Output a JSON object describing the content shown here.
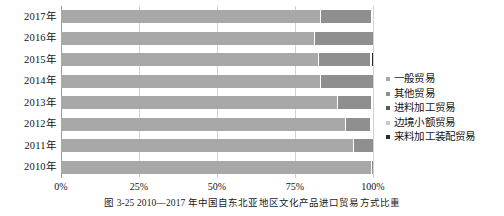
{
  "caption": "图 3-25  2010—2017 年中国自东北亚地区文化产品进口贸易方式比重",
  "axis": {
    "xticks": [
      "0%",
      "25%",
      "50%",
      "75%",
      "100%"
    ]
  },
  "legend": {
    "items": [
      {
        "label": "一般贸易",
        "color": "#a8a8a8"
      },
      {
        "label": "其他贸易",
        "color": "#8f8f8f"
      },
      {
        "label": "进料加工贸易",
        "color": "#5a5a5a"
      },
      {
        "label": "边境小额贸易",
        "color": "#c9c9c9"
      },
      {
        "label": "来料加工装配贸易",
        "color": "#2b2b2b"
      }
    ]
  },
  "chart_data": {
    "type": "bar",
    "title": "图 3-25  2010—2017 年中国自东北亚地区文化产品进口贸易方式比重",
    "orientation": "horizontal",
    "stacked": true,
    "normalized": "100%",
    "xlabel": "",
    "ylabel": "",
    "xlim": [
      0,
      100
    ],
    "grid": true,
    "legend_position": "right",
    "categories": [
      "2017年",
      "2016年",
      "2015年",
      "2014年",
      "2013年",
      "2012年",
      "2011年",
      "2010年"
    ],
    "series": [
      {
        "name": "一般贸易",
        "color": "#a8a8a8",
        "values": [
          83.0,
          81.0,
          82.5,
          83.0,
          88.5,
          91.0,
          93.5,
          99.5
        ]
      },
      {
        "name": "其他贸易",
        "color": "#8f8f8f",
        "values": [
          16.4,
          19.0,
          16.4,
          17.0,
          11.0,
          8.0,
          6.5,
          0.5
        ]
      },
      {
        "name": "进料加工贸易",
        "color": "#5a5a5a",
        "values": [
          0.2,
          0.0,
          0.3,
          0.0,
          0.3,
          0.4,
          0.0,
          0.0
        ]
      },
      {
        "name": "边境小额贸易",
        "color": "#c9c9c9",
        "values": [
          0.0,
          0.0,
          0.0,
          0.0,
          0.2,
          0.2,
          0.0,
          0.0
        ]
      },
      {
        "name": "来料加工装配贸易",
        "color": "#2b2b2b",
        "values": [
          0.4,
          0.0,
          0.8,
          0.0,
          0.0,
          0.4,
          0.0,
          0.0
        ]
      }
    ]
  }
}
